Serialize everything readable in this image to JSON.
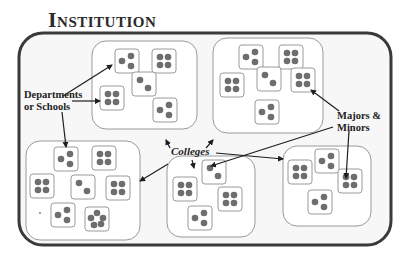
{
  "title": "Institution",
  "labels": {
    "departments": [
      "Departments",
      "or Schools"
    ],
    "colleges": "Colleges",
    "majors": [
      "Majors &",
      "Minors"
    ]
  },
  "colors": {
    "outer_border": "#3a3a3a",
    "outer_fill": "#f7f7f7",
    "college_border": "#9a9a9a",
    "college_fill": "#ffffff",
    "dept_border": "#9a9a9a",
    "dot": "#6e6e6e",
    "arrow": "#1e1e1e"
  },
  "institution": {
    "x": 19,
    "y": 33,
    "w": 372,
    "h": 212,
    "r": 24
  },
  "colleges": [
    {
      "name": "college-top-left",
      "x": 92,
      "y": 41,
      "w": 105,
      "h": 88,
      "depts": [
        {
          "x": 23,
          "y": 8,
          "dots": 3
        },
        {
          "x": 60,
          "y": 8,
          "dots": 4
        },
        {
          "x": 40,
          "y": 31,
          "dots": 2
        },
        {
          "x": 8,
          "y": 45,
          "dots": 4
        },
        {
          "x": 61,
          "y": 57,
          "dots": 3
        }
      ]
    },
    {
      "name": "college-top-right",
      "x": 213,
      "y": 38,
      "w": 110,
      "h": 95,
      "depts": [
        {
          "x": 26,
          "y": 7,
          "dots": 3
        },
        {
          "x": 66,
          "y": 7,
          "dots": 4
        },
        {
          "x": 7,
          "y": 35,
          "dots": 4
        },
        {
          "x": 44,
          "y": 29,
          "dots": 2
        },
        {
          "x": 78,
          "y": 30,
          "dots": 4
        },
        {
          "x": 42,
          "y": 62,
          "dots": 3
        }
      ]
    },
    {
      "name": "college-bottom-left",
      "x": 26,
      "y": 141,
      "w": 114,
      "h": 99,
      "depts": [
        {
          "x": 28,
          "y": 6,
          "dots": 3
        },
        {
          "x": 66,
          "y": 5,
          "dots": 4
        },
        {
          "x": 4,
          "y": 33,
          "dots": 4
        },
        {
          "x": 45,
          "y": 34,
          "dots": 2
        },
        {
          "x": 80,
          "y": 35,
          "dots": 4
        },
        {
          "x": 25,
          "y": 62,
          "dots": 3
        },
        {
          "x": 59,
          "y": 66,
          "dots": 5
        }
      ]
    },
    {
      "name": "college-bottom-center",
      "x": 167,
      "y": 156,
      "w": 88,
      "h": 81,
      "depts": [
        {
          "x": 35,
          "y": 4,
          "dots": 2
        },
        {
          "x": 6,
          "y": 21,
          "dots": 4
        },
        {
          "x": 51,
          "y": 31,
          "dots": 4
        },
        {
          "x": 21,
          "y": 50,
          "dots": 3
        }
      ]
    },
    {
      "name": "college-bottom-right",
      "x": 283,
      "y": 146,
      "w": 88,
      "h": 80,
      "depts": [
        {
          "x": 5,
          "y": 14,
          "dots": 4
        },
        {
          "x": 32,
          "y": 3,
          "dots": 3
        },
        {
          "x": 55,
          "y": 23,
          "dots": 4
        },
        {
          "x": 25,
          "y": 44,
          "dots": 3
        }
      ]
    }
  ],
  "stray_dot": {
    "x": 40,
    "y": 213
  },
  "arrows": [
    {
      "name": "dept-arrow-1",
      "x1": 63,
      "y1": 96,
      "x2": 112,
      "y2": 65
    },
    {
      "name": "dept-arrow-2",
      "x1": 72,
      "y1": 101,
      "x2": 100,
      "y2": 101
    },
    {
      "name": "dept-arrow-3",
      "x1": 62,
      "y1": 112,
      "x2": 66,
      "y2": 147
    },
    {
      "name": "colleges-arrow-1",
      "x1": 168,
      "y1": 164,
      "x2": 140,
      "y2": 181
    },
    {
      "name": "colleges-arrow-2",
      "x1": 170,
      "y1": 148,
      "x2": 166,
      "y2": 140
    },
    {
      "name": "colleges-arrow-3",
      "x1": 206,
      "y1": 148,
      "x2": 213,
      "y2": 140
    },
    {
      "name": "colleges-arrow-4",
      "x1": 192,
      "y1": 160,
      "x2": 194,
      "y2": 168
    },
    {
      "name": "colleges-arrow-5",
      "x1": 216,
      "y1": 153,
      "x2": 283,
      "y2": 159
    },
    {
      "name": "majors-arrow-1",
      "x1": 339,
      "y1": 111,
      "x2": 311,
      "y2": 90
    },
    {
      "name": "majors-arrow-2",
      "x1": 333,
      "y1": 127,
      "x2": 211,
      "y2": 166
    },
    {
      "name": "majors-arrow-3",
      "x1": 349,
      "y1": 131,
      "x2": 346,
      "y2": 178
    }
  ]
}
